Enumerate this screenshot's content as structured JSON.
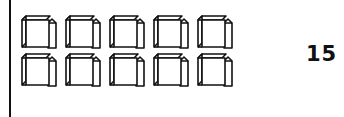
{
  "figure": {
    "cube_rows": 2,
    "cubes_per_row": 5,
    "cube_count": 10,
    "line_color": "#111111"
  },
  "answer": {
    "label": "15"
  }
}
